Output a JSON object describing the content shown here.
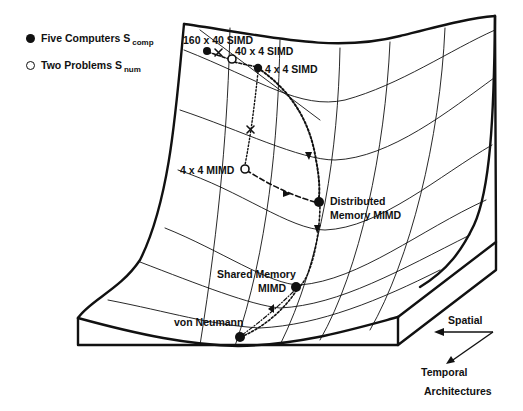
{
  "legend": {
    "computers": {
      "label": "Five Computers S",
      "sub": "comp",
      "marker": "filled-circle"
    },
    "problems": {
      "label": "Two Problems S",
      "sub": "num",
      "marker": "open-circle"
    }
  },
  "points": {
    "simd_160x40": "160 x 40 SIMD",
    "simd_40x4": "40 x 4 SIMD",
    "simd_4x4": "4 x 4 SIMD",
    "mimd_4x4": "4 x 4 MIMD",
    "distributed_line1": "Distributed",
    "distributed_line2": "Memory MIMD",
    "shared_line1": "Shared Memory",
    "shared_line2": "MIMD",
    "von_neumann": "von Neumann"
  },
  "axes": {
    "spatial": "Spatial",
    "temporal": "Temporal",
    "caption": "Architectures"
  },
  "colors": {
    "ink": "#111111",
    "background": "#ffffff"
  }
}
